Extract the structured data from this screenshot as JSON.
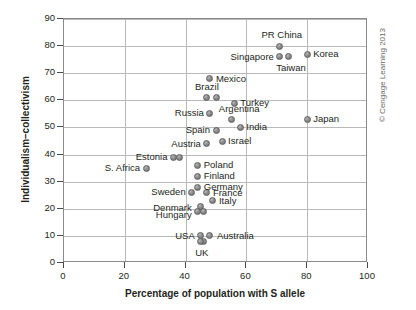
{
  "credit": "© Cengage Learning 2013",
  "chart_data": {
    "type": "scatter",
    "title": "",
    "xlabel": "Percentage of population with S allele",
    "ylabel": "Individualism–collectivism",
    "xlim": [
      0,
      100
    ],
    "ylim": [
      0,
      90
    ],
    "xticks": [
      0,
      20,
      40,
      60,
      80,
      100
    ],
    "yticks": [
      0,
      10,
      20,
      30,
      40,
      50,
      60,
      70,
      80,
      90
    ],
    "grid": true,
    "legend": "none",
    "points": [
      {
        "label": "PR China",
        "x": 71,
        "y": 80,
        "label_pos": "c",
        "label_dx": 2,
        "label_dy": -11
      },
      {
        "label": "Singapore",
        "x": 71,
        "y": 76,
        "label_pos": "r",
        "label_dx": -6,
        "label_dy": 0
      },
      {
        "label": "Taiwan",
        "x": 74,
        "y": 76,
        "label_pos": "c",
        "label_dx": 2,
        "label_dy": 11
      },
      {
        "label": "Korea",
        "x": 80,
        "y": 77,
        "label_pos": "l",
        "label_dx": 6,
        "label_dy": 0
      },
      {
        "label": "Mexico",
        "x": 48,
        "y": 68,
        "label_pos": "l",
        "label_dx": 6,
        "label_dy": 0
      },
      {
        "label": "Brazil",
        "x": 47,
        "y": 61,
        "label_pos": "c",
        "label_dx": 0,
        "label_dy": -11
      },
      {
        "label": "",
        "x": 50,
        "y": 61,
        "label_pos": "c",
        "label_dx": 0,
        "label_dy": 0
      },
      {
        "label": "Turkey",
        "x": 56,
        "y": 59,
        "label_pos": "l",
        "label_dx": 6,
        "label_dy": 0
      },
      {
        "label": "Russia",
        "x": 48,
        "y": 55,
        "label_pos": "r",
        "label_dx": -6,
        "label_dy": -1
      },
      {
        "label": "Argentina",
        "x": 55,
        "y": 53,
        "label_pos": "c",
        "label_dx": 8,
        "label_dy": -10
      },
      {
        "label": "Japan",
        "x": 80,
        "y": 53,
        "label_pos": "l",
        "label_dx": 6,
        "label_dy": 0
      },
      {
        "label": "Spain",
        "x": 50,
        "y": 49,
        "label_pos": "r",
        "label_dx": -6,
        "label_dy": 0
      },
      {
        "label": "India",
        "x": 58,
        "y": 50,
        "label_pos": "l",
        "label_dx": 6,
        "label_dy": 0
      },
      {
        "label": "Israel",
        "x": 52,
        "y": 45,
        "label_pos": "l",
        "label_dx": 6,
        "label_dy": 0
      },
      {
        "label": "Austria",
        "x": 47,
        "y": 44,
        "label_pos": "r",
        "label_dx": -6,
        "label_dy": 0
      },
      {
        "label": "Estonia",
        "x": 36,
        "y": 39,
        "label_pos": "r",
        "label_dx": -6,
        "label_dy": 0
      },
      {
        "label": "",
        "x": 38,
        "y": 39,
        "label_pos": "c",
        "label_dx": 0,
        "label_dy": 0
      },
      {
        "label": "S. Africa",
        "x": 27,
        "y": 35,
        "label_pos": "r",
        "label_dx": -6,
        "label_dy": 0
      },
      {
        "label": "Poland",
        "x": 44,
        "y": 36,
        "label_pos": "l",
        "label_dx": 6,
        "label_dy": 0
      },
      {
        "label": "Finland",
        "x": 44,
        "y": 32,
        "label_pos": "l",
        "label_dx": 6,
        "label_dy": 0
      },
      {
        "label": "Germany",
        "x": 44,
        "y": 28,
        "label_pos": "l",
        "label_dx": 6,
        "label_dy": 0
      },
      {
        "label": "Sweden",
        "x": 42,
        "y": 26,
        "label_pos": "r",
        "label_dx": -6,
        "label_dy": -1
      },
      {
        "label": "France",
        "x": 47,
        "y": 26,
        "label_pos": "l",
        "label_dx": 6,
        "label_dy": 0
      },
      {
        "label": "Italy",
        "x": 49,
        "y": 23,
        "label_pos": "l",
        "label_dx": 6,
        "label_dy": 0
      },
      {
        "label": "Denmark",
        "x": 45,
        "y": 21,
        "label_pos": "r",
        "label_dx": -9,
        "label_dy": 2
      },
      {
        "label": "",
        "x": 46,
        "y": 19,
        "label_pos": "c",
        "label_dx": 0,
        "label_dy": 0
      },
      {
        "label": "Hungary",
        "x": 44,
        "y": 19,
        "label_pos": "r",
        "label_dx": -6,
        "label_dy": 4
      },
      {
        "label": "USA",
        "x": 45,
        "y": 10,
        "label_pos": "r",
        "label_dx": -6,
        "label_dy": 0
      },
      {
        "label": "Australia",
        "x": 48,
        "y": 10,
        "label_pos": "l",
        "label_dx": 7,
        "label_dy": 0
      },
      {
        "label": "",
        "x": 46,
        "y": 8,
        "label_pos": "c",
        "label_dx": 0,
        "label_dy": 0
      },
      {
        "label": "UK",
        "x": 45,
        "y": 8,
        "label_pos": "c",
        "label_dx": 1,
        "label_dy": 12
      }
    ]
  }
}
